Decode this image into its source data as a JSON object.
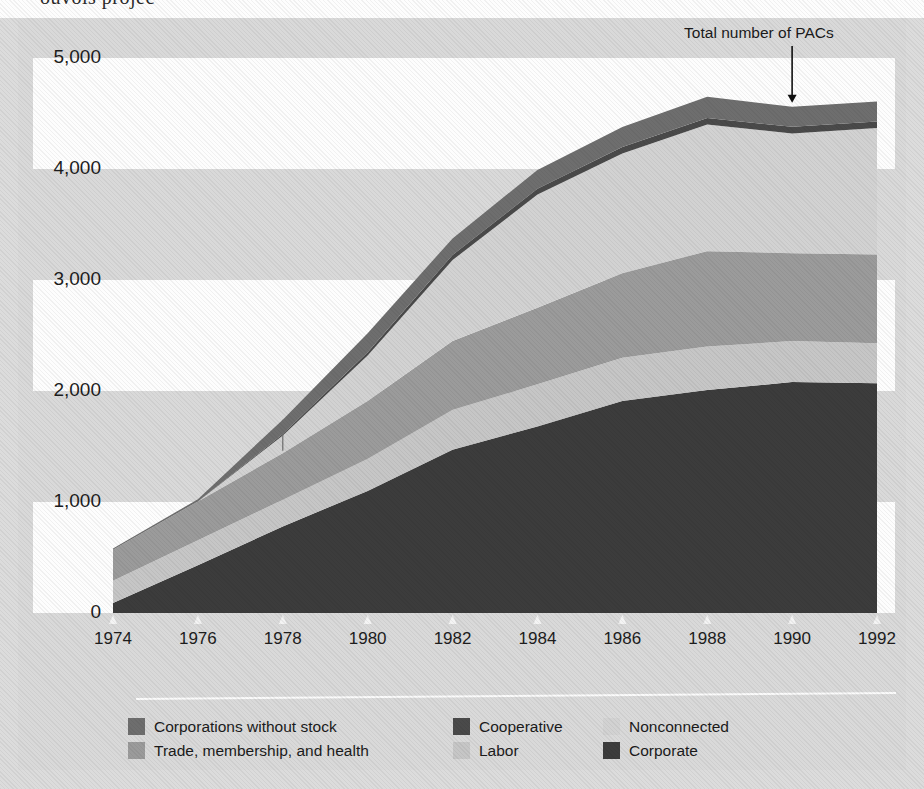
{
  "page": {
    "clipped_heading": "ouvois projec",
    "background_color": "#d9d9d9",
    "board_color": "#d9d9d9"
  },
  "annotation": {
    "label": "Total number of PACs",
    "arrow": "down-arrow",
    "points_at_year": 1990
  },
  "legend": {
    "rows": [
      [
        {
          "label": "Corporations without stock",
          "color": "#6e6e6e"
        },
        {
          "label": "Cooperative",
          "color": "#4a4a4a"
        },
        {
          "label": "Nonconnected",
          "color": "#d2d2d2"
        }
      ],
      [
        {
          "label": "Trade, membership, and health",
          "color": "#9b9b9b"
        },
        {
          "label": "Labor",
          "color": "#c6c6c6"
        },
        {
          "label": "Corporate",
          "color": "#3c3c3c"
        }
      ]
    ]
  },
  "chart_data": {
    "type": "area",
    "stacked": true,
    "title": "",
    "xlabel": "",
    "ylabel": "",
    "x": [
      1974,
      1976,
      1978,
      1980,
      1982,
      1984,
      1986,
      1988,
      1990,
      1992
    ],
    "categories": [
      "1974",
      "1976",
      "1978",
      "1980",
      "1982",
      "1984",
      "1986",
      "1988",
      "1990",
      "1992"
    ],
    "xtick_labels": [
      "1974",
      "1976",
      "1978",
      "1980",
      "1982",
      "1984",
      "1986",
      "1988",
      "1990",
      "1992"
    ],
    "ytick_labels": [
      "0",
      "1,000",
      "2,000",
      "3,000",
      "4,000",
      "5,000"
    ],
    "yticks": [
      0,
      1000,
      2000,
      3000,
      4000,
      5000
    ],
    "ylim": [
      0,
      5000
    ],
    "xlim": [
      1974,
      1992
    ],
    "grid": false,
    "banded_background": true,
    "legend_position": "below",
    "stack_order_bottom_to_top": [
      "Corporate",
      "Labor",
      "Trade, membership, and health",
      "Nonconnected",
      "Cooperative",
      "Corporations without stock"
    ],
    "series": [
      {
        "name": "Corporate",
        "color": "#3c3c3c",
        "values": [
          90,
          430,
          780,
          1100,
          1470,
          1680,
          1910,
          2010,
          2080,
          2070
        ]
      },
      {
        "name": "Labor",
        "color": "#c6c6c6",
        "values": [
          200,
          225,
          240,
          290,
          360,
          380,
          390,
          390,
          370,
          360
        ]
      },
      {
        "name": "Trade, membership, and health",
        "color": "#9b9b9b",
        "values": [
          280,
          350,
          420,
          520,
          620,
          690,
          760,
          860,
          790,
          800
        ]
      },
      {
        "name": "Nonconnected",
        "color": "#d2d2d2",
        "values": [
          0,
          0,
          160,
          410,
          730,
          1020,
          1080,
          1140,
          1080,
          1140
        ]
      },
      {
        "name": "Cooperative",
        "color": "#4a4a4a",
        "values": [
          0,
          0,
          12,
          30,
          45,
          52,
          58,
          60,
          60,
          58
        ]
      },
      {
        "name": "Corporations without stock",
        "color": "#6e6e6e",
        "values": [
          10,
          20,
          130,
          170,
          150,
          170,
          180,
          190,
          180,
          180
        ]
      }
    ],
    "totals": [
      580,
      1025,
      1742,
      2520,
      3375,
      3992,
      4378,
      4650,
      4560,
      4608
    ],
    "total_line_label": "Total number of PACs"
  }
}
